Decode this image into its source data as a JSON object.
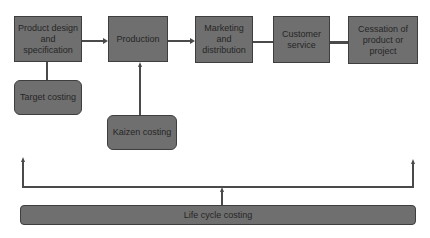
{
  "diagram": {
    "stages": [
      {
        "label": "Product design and specification"
      },
      {
        "label": "Production"
      },
      {
        "label": "Marketing and distribution"
      },
      {
        "label": "Customer service"
      },
      {
        "label": "Cessation of product or project"
      }
    ],
    "costing_methods": {
      "target": "Target costing",
      "kaizen": "Kaizen costing",
      "life_cycle": "Life cycle costing"
    },
    "colors": {
      "box_fill": "#6f6f6f",
      "box_border": "#3e3e3e",
      "line": "#4a4a4a",
      "text": "#262626"
    }
  }
}
